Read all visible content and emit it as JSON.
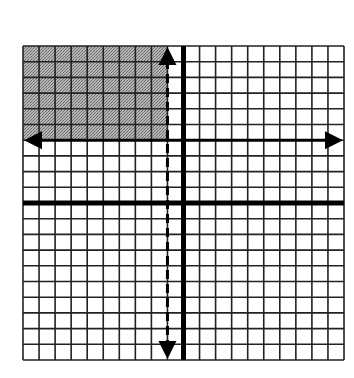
{
  "graph": {
    "type": "coordinate-plane-inequality",
    "x_range": [
      -10,
      10
    ],
    "y_range": [
      -10,
      10
    ],
    "grid_step": 1,
    "origin_px": [
      184,
      203
    ],
    "cell_w": 16.05,
    "cell_h": 15.7,
    "left_px": 23,
    "top_px": 46,
    "colors": {
      "background": "#ffffff",
      "grid": "#222222",
      "axis": "#000000",
      "shade": "#9a9a9a",
      "boundary": "#000000"
    },
    "shaded_region": {
      "x_max": -1,
      "y_min": 4,
      "description": "x < -1 and y > 4"
    },
    "boundaries": [
      {
        "name": "y-equals-4",
        "orientation": "horizontal",
        "value": 4,
        "style": "solid",
        "arrows": "both"
      },
      {
        "name": "x-equals-neg-1",
        "orientation": "vertical",
        "value": -1,
        "style": "dashed",
        "arrows": "both"
      }
    ]
  },
  "chart_data": {
    "type": "region",
    "title": "",
    "xlabel": "",
    "ylabel": "",
    "xlim": [
      -10,
      10
    ],
    "ylim": [
      -10,
      10
    ],
    "grid": true,
    "lines": [
      {
        "equation": "y = 4",
        "style": "solid"
      },
      {
        "equation": "x = -1",
        "style": "dashed"
      }
    ],
    "shaded": "x < -1 and y >= 4"
  }
}
